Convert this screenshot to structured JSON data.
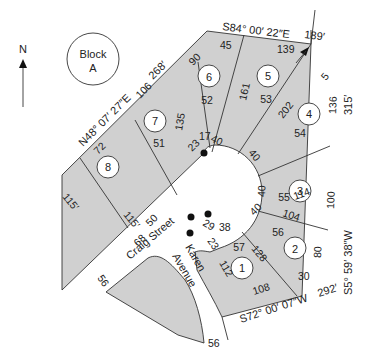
{
  "north_arrow": {
    "label": "N"
  },
  "block": {
    "line1": "Block",
    "line2": "A"
  },
  "streets": {
    "craig": "Craig Street",
    "karen_line1": "Karen",
    "karen_line2": "Avenue"
  },
  "bearings": {
    "northwest": "N48° 07′ 27″E",
    "northwest_length": "268′",
    "north": "S84° 00′ 22″E",
    "north_length": "189′",
    "east": "S5° 59′ 38″W",
    "east_length": "315′",
    "south": "S72° 00′ 07″W",
    "south_length": "292′",
    "west_lot8": "115′",
    "west_lot8_side": "115′"
  },
  "lots": [
    {
      "number": "1",
      "area": "57"
    },
    {
      "number": "2",
      "area": "56"
    },
    {
      "number": "3",
      "area": "55"
    },
    {
      "number": "4",
      "area": "54"
    },
    {
      "number": "5",
      "area": "53"
    },
    {
      "number": "6",
      "area": "52"
    },
    {
      "number": "7",
      "area": "51"
    },
    {
      "number": "8",
      "area": "50"
    }
  ],
  "dimensions": {
    "d45": "45",
    "d139": "139",
    "d90": "90",
    "d161": "161",
    "d5": "5",
    "d202": "202",
    "d136": "136",
    "d106": "106",
    "d135": "135",
    "d72": "72",
    "d17": "17",
    "d23a": "23",
    "d40a": "40",
    "d40b": "40",
    "d114": "114",
    "d100": "100",
    "d40c": "40",
    "d104": "104",
    "d80": "80",
    "d40d": "40",
    "d29": "29",
    "d38": "38",
    "d23b": "23",
    "d128": "128",
    "d112": "112",
    "d30": "30",
    "d108": "108",
    "d50a": "50",
    "d68": "68",
    "d56a": "56",
    "d56b": "56"
  }
}
